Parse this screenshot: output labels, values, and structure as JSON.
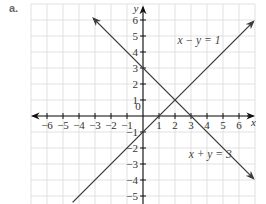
{
  "part_label": "a.",
  "chart_data": {
    "type": "line",
    "title": "",
    "xlabel": "x",
    "ylabel": "y",
    "xlim": [
      -7,
      7
    ],
    "ylim": [
      -5.5,
      7
    ],
    "grid": true,
    "x_ticks": [
      -6,
      -5,
      -4,
      -3,
      -2,
      -1,
      0,
      1,
      2,
      3,
      4,
      5,
      6
    ],
    "y_ticks": [
      -5,
      -4,
      -3,
      -2,
      -1,
      1,
      2,
      3,
      4,
      5,
      6
    ],
    "x_tick_labels": [
      "−6",
      "−5",
      "−4",
      "−3",
      "−2",
      "−1",
      "0",
      "1",
      "2",
      "3",
      "4",
      "5",
      "6"
    ],
    "y_tick_labels": [
      "−5",
      "−4",
      "−3",
      "−2",
      "−1",
      "1",
      "2",
      "3",
      "4",
      "5",
      "6"
    ],
    "series": [
      {
        "name": "x − y = 1",
        "equation": "y = x - 1",
        "slope": 1,
        "intercept": -1,
        "x": [
          -4.4,
          6.9
        ],
        "y": [
          -5.4,
          5.9
        ],
        "label_position": [
          3.5,
          4.5
        ]
      },
      {
        "name": "x + y = 3",
        "equation": "y = -x + 3",
        "slope": -1,
        "intercept": 3,
        "x": [
          -3.1,
          6.9
        ],
        "y": [
          6.1,
          -3.9
        ],
        "label_position": [
          4.2,
          -2.6
        ]
      }
    ],
    "intersection": {
      "x": 2,
      "y": 1
    },
    "annotations": [
      "x − y = 1",
      "x + y = 3"
    ]
  }
}
